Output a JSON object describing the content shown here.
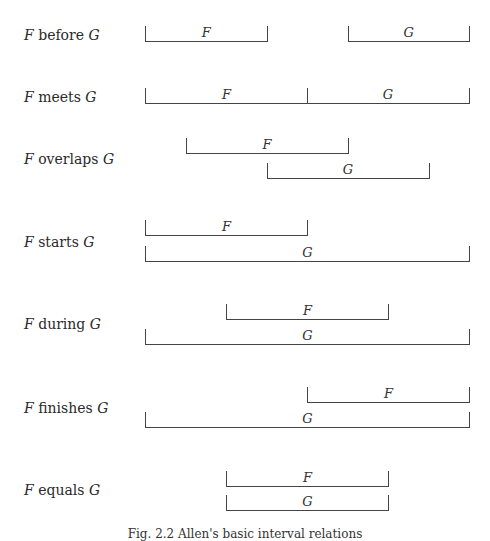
{
  "figure": {
    "caption": "Fig. 2.2   Allen's basic interval relations",
    "grid": {
      "x_start": 145,
      "step": 40.5
    },
    "relations": [
      {
        "id": "before",
        "label_prefix": "F",
        "label_verb": "before",
        "label_suffix": "G",
        "label_y": 27,
        "bars": [
          {
            "name": "F",
            "x0": 0,
            "x1": 3,
            "bottom": 42
          },
          {
            "name": "G",
            "x0": 5,
            "x1": 8,
            "bottom": 42
          }
        ]
      },
      {
        "id": "meets",
        "label_prefix": "F",
        "label_verb": "meets",
        "label_suffix": "G",
        "label_y": 89,
        "bars": [
          {
            "name": "F",
            "x0": 0,
            "x1": 4,
            "bottom": 104
          },
          {
            "name": "G",
            "x0": 4,
            "x1": 8,
            "bottom": 104
          }
        ]
      },
      {
        "id": "overlaps",
        "label_prefix": "F",
        "label_verb": "overlaps",
        "label_suffix": "G",
        "label_y": 151,
        "bars": [
          {
            "name": "F",
            "x0": 1,
            "x1": 5,
            "bottom": 154
          },
          {
            "name": "G",
            "x0": 3,
            "x1": 7,
            "bottom": 179
          }
        ]
      },
      {
        "id": "starts",
        "label_prefix": "F",
        "label_verb": "starts",
        "label_suffix": "G",
        "label_y": 234,
        "bars": [
          {
            "name": "F",
            "x0": 0,
            "x1": 4,
            "bottom": 236
          },
          {
            "name": "G",
            "x0": 0,
            "x1": 8,
            "bottom": 262
          }
        ]
      },
      {
        "id": "during",
        "label_prefix": "F",
        "label_verb": "during",
        "label_suffix": "G",
        "label_y": 316,
        "bars": [
          {
            "name": "F",
            "x0": 2,
            "x1": 6,
            "bottom": 320
          },
          {
            "name": "G",
            "x0": 0,
            "x1": 8,
            "bottom": 345
          }
        ]
      },
      {
        "id": "finishes",
        "label_prefix": "F",
        "label_verb": "finishes",
        "label_suffix": "G",
        "label_y": 400,
        "bars": [
          {
            "name": "F",
            "x0": 4,
            "x1": 8,
            "bottom": 403
          },
          {
            "name": "G",
            "x0": 0,
            "x1": 8,
            "bottom": 428
          }
        ]
      },
      {
        "id": "equals",
        "label_prefix": "F",
        "label_verb": "equals",
        "label_suffix": "G",
        "label_y": 482,
        "bars": [
          {
            "name": "F",
            "x0": 2,
            "x1": 6,
            "bottom": 487
          },
          {
            "name": "G",
            "x0": 2,
            "x1": 6,
            "bottom": 511
          }
        ]
      }
    ]
  }
}
